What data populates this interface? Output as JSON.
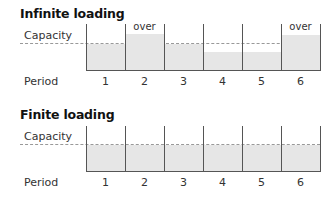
{
  "charts": [
    {
      "title": "Infinite loading",
      "capacity_label": "Capacity",
      "period_label": "Period",
      "periods": [
        {
          "label": "1",
          "load_pct": 100,
          "over": ""
        },
        {
          "label": "2",
          "load_pct": 140,
          "over": "over"
        },
        {
          "label": "3",
          "load_pct": 100,
          "over": ""
        },
        {
          "label": "4",
          "load_pct": 70,
          "over": ""
        },
        {
          "label": "5",
          "load_pct": 70,
          "over": ""
        },
        {
          "label": "6",
          "load_pct": 135,
          "over": "over"
        }
      ]
    },
    {
      "title": "Finite loading",
      "capacity_label": "Capacity",
      "period_label": "Period",
      "periods": [
        {
          "label": "1",
          "load_pct": 100,
          "over": ""
        },
        {
          "label": "2",
          "load_pct": 100,
          "over": ""
        },
        {
          "label": "3",
          "load_pct": 100,
          "over": ""
        },
        {
          "label": "4",
          "load_pct": 100,
          "over": ""
        },
        {
          "label": "5",
          "load_pct": 100,
          "over": ""
        },
        {
          "label": "6",
          "load_pct": 100,
          "over": ""
        }
      ]
    }
  ],
  "colors": {
    "fill": "#e6e6e6",
    "lines": "#555555",
    "capacity_dash": "#999999"
  }
}
